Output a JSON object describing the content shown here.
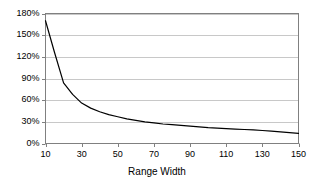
{
  "chart_data": {
    "type": "line",
    "title": "",
    "subtitle": "",
    "xlabel": "Range Width",
    "ylabel": "",
    "xlim": [
      10,
      150
    ],
    "ylim": [
      0,
      180
    ],
    "grid": "horizontal",
    "legend": "none",
    "line_color": "#000000",
    "grid_color": "#c8c8c8",
    "axis_color": "#808080",
    "xticks": [
      10,
      30,
      50,
      70,
      90,
      110,
      130,
      150
    ],
    "xtick_labels": [
      "10",
      "30",
      "50",
      "70",
      "90",
      "110",
      "130",
      "150"
    ],
    "yticks": [
      0,
      30,
      60,
      90,
      120,
      150,
      180
    ],
    "ytick_labels": [
      "0%",
      "30%",
      "60%",
      "90%",
      "120%",
      "150%",
      "180%"
    ],
    "series": [
      {
        "name": "",
        "x": [
          10,
          15,
          20,
          25,
          30,
          35,
          40,
          45,
          50,
          55,
          60,
          65,
          70,
          75,
          80,
          85,
          90,
          95,
          100,
          105,
          110,
          115,
          120,
          125,
          130,
          135,
          140,
          145,
          150
        ],
        "values": [
          170,
          126,
          84,
          68,
          56,
          49,
          44,
          40,
          37,
          34,
          32,
          30,
          28.5,
          27,
          26,
          25,
          24,
          23,
          22,
          21.3,
          20.6,
          20,
          19.4,
          18.8,
          18,
          17,
          16,
          15,
          14
        ]
      }
    ]
  },
  "axis": {
    "x_title": "Range Width"
  }
}
